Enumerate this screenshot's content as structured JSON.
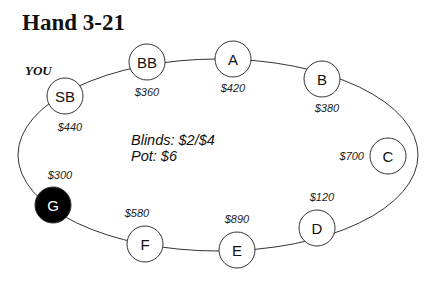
{
  "title": "Hand 3-21",
  "hero_label": "YOU",
  "info": {
    "blinds": "Blinds: $2/$4",
    "pot": "Pot: $6"
  },
  "colors": {
    "seat_fill": "#ffffff",
    "hero_seat_fill": "#000000",
    "line": "#333333"
  },
  "seats": [
    {
      "id": "SB",
      "label": "SB",
      "stack": "$440",
      "cx": 65,
      "cy": 96,
      "sx": 70,
      "sy": 131,
      "anchor": "middle",
      "dark": false
    },
    {
      "id": "BB",
      "label": "BB",
      "stack": "$360",
      "cx": 147,
      "cy": 62,
      "sx": 147,
      "sy": 96,
      "anchor": "middle",
      "dark": false
    },
    {
      "id": "A",
      "label": "A",
      "stack": "$420",
      "cx": 233,
      "cy": 59,
      "sx": 233,
      "sy": 92,
      "anchor": "middle",
      "dark": false
    },
    {
      "id": "B",
      "label": "B",
      "stack": "$380",
      "cx": 322,
      "cy": 79,
      "sx": 327,
      "sy": 112,
      "anchor": "middle",
      "dark": false
    },
    {
      "id": "C",
      "label": "C",
      "stack": "$700",
      "cx": 388,
      "cy": 156,
      "sx": 364,
      "sy": 160,
      "anchor": "end",
      "dark": false
    },
    {
      "id": "D",
      "label": "D",
      "stack": "$120",
      "cx": 317,
      "cy": 228,
      "sx": 322,
      "sy": 201,
      "anchor": "middle",
      "dark": false
    },
    {
      "id": "E",
      "label": "E",
      "stack": "$890",
      "cx": 237,
      "cy": 250,
      "sx": 237,
      "sy": 223,
      "anchor": "middle",
      "dark": false
    },
    {
      "id": "F",
      "label": "F",
      "stack": "$580",
      "cx": 145,
      "cy": 244,
      "sx": 137,
      "sy": 217,
      "anchor": "middle",
      "dark": false
    },
    {
      "id": "G",
      "label": "G",
      "stack": "$300",
      "cx": 53,
      "cy": 205,
      "sx": 60,
      "sy": 179,
      "anchor": "middle",
      "dark": true
    }
  ]
}
